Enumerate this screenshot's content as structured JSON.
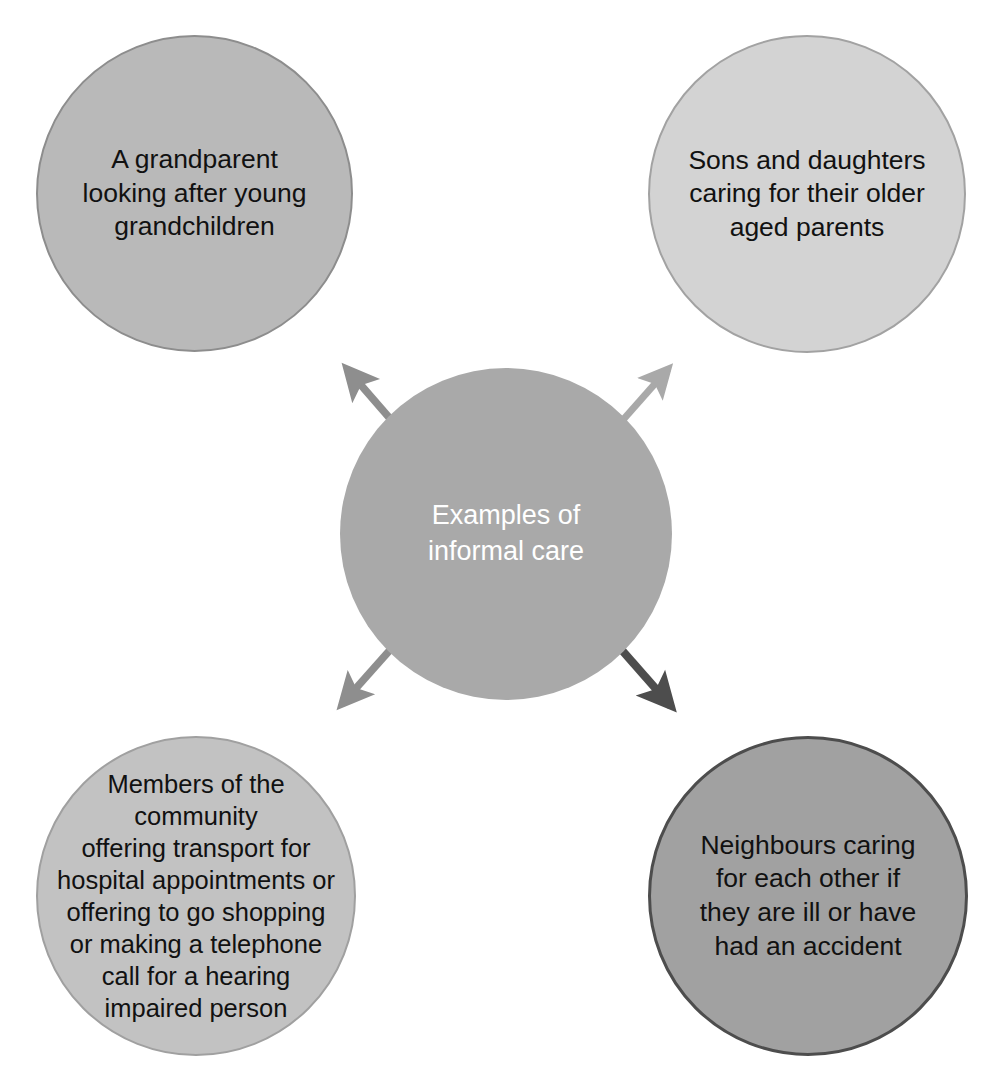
{
  "diagram": {
    "title": "Examples of informal care",
    "type": "radial-hub-and-spoke",
    "canvas": {
      "width": 1004,
      "height": 1083,
      "background": "#ffffff"
    },
    "scan_artifact_text": "l     y        l",
    "center": {
      "id": "center",
      "label": "Examples of\ninformal care",
      "fill": "#a9a9a9",
      "text_color": "#ffffff",
      "border": "none",
      "cx": 506,
      "cy": 534,
      "r": 166
    },
    "nodes": [
      {
        "id": "grandparent",
        "position": "top-left",
        "label": "A grandparent\nlooking after young\ngrandchildren",
        "fill": "#b9b9b9",
        "border": "#8d8d8d",
        "text_color": "#111111",
        "cx": 194,
        "cy": 193,
        "r": 158
      },
      {
        "id": "sons-daughters",
        "position": "top-right",
        "label": "Sons and daughters\ncaring for their older\naged parents",
        "fill": "#d3d3d3",
        "border": "#a2a2a2",
        "text_color": "#111111",
        "cx": 807,
        "cy": 194,
        "r": 159
      },
      {
        "id": "community",
        "position": "bottom-left",
        "label": "Members of the\ncommunity\noffering transport for\nhospital appointments or\noffering to go shopping\nor making a telephone\ncall for a hearing\nimpaired person",
        "fill": "#c2c2c2",
        "border": "#a0a0a0",
        "text_color": "#111111",
        "cx": 196,
        "cy": 896,
        "r": 160
      },
      {
        "id": "neighbours",
        "position": "bottom-right",
        "label": "Neighbours caring\nfor each other if\nthey are ill or have\nhad an accident",
        "fill": "#a1a1a1",
        "border": "#4d4d4d",
        "text_color": "#111111",
        "cx": 808,
        "cy": 896,
        "r": 160
      }
    ],
    "arrows": [
      {
        "id": "arrow-to-grandparent",
        "from": "center",
        "to": "grandparent",
        "color": "#8e8e8e",
        "direction": "up-left"
      },
      {
        "id": "arrow-to-sons-daughters",
        "from": "center",
        "to": "sons-daughters",
        "color": "#a9a9a9",
        "direction": "up-right"
      },
      {
        "id": "arrow-to-community",
        "from": "center",
        "to": "community",
        "color": "#8e8e8e",
        "direction": "down-left"
      },
      {
        "id": "arrow-to-neighbours",
        "from": "center",
        "to": "neighbours",
        "color": "#4d4d4d",
        "direction": "down-right"
      }
    ]
  }
}
